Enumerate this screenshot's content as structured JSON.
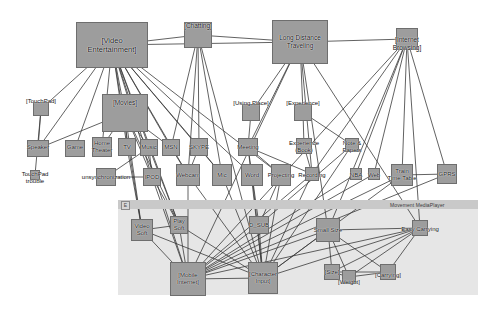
{
  "diagram": {
    "band": {
      "title": "Movement MediaPlayer",
      "icon": "E",
      "icon_name": "expand-icon"
    },
    "colors": {
      "node_fill": "#9d9d9d",
      "node_stroke": "#6e6e6e",
      "edge": "#3a3a3a",
      "band_header": "#c9c9c9",
      "band_body": "#e6e6e6",
      "text": "#111111",
      "background": "#ffffff"
    },
    "nodes": [
      {
        "id": "video_entertainment",
        "label": "[Video\nEntertainment]",
        "x": 76,
        "y": 22,
        "w": 72,
        "h": 46,
        "lx": 112,
        "ly": 45,
        "cls": "lg"
      },
      {
        "id": "chatting",
        "label": "[Chatting]",
        "x": 184,
        "y": 22,
        "w": 28,
        "h": 26,
        "lx": 198,
        "ly": 26,
        "cls": ""
      },
      {
        "id": "long_distance_traveling",
        "label": "Long Distance\nTraveling",
        "x": 272,
        "y": 20,
        "w": 56,
        "h": 44,
        "lx": 300,
        "ly": 41,
        "cls": ""
      },
      {
        "id": "internet_browsing",
        "label": "[Internet\nBrowsing]",
        "x": 396,
        "y": 28,
        "w": 22,
        "h": 22,
        "lx": 407,
        "ly": 43,
        "cls": ""
      },
      {
        "id": "touchpad",
        "label": "[TouchPad]",
        "x": 33,
        "y": 102,
        "w": 16,
        "h": 14,
        "lx": 41,
        "ly": 101,
        "cls": "sm"
      },
      {
        "id": "movies",
        "label": "[Movies]",
        "x": 102,
        "y": 94,
        "w": 46,
        "h": 38,
        "lx": 125,
        "ly": 103,
        "cls": ""
      },
      {
        "id": "using_place",
        "label": "[Using Place]",
        "x": 242,
        "y": 104,
        "w": 18,
        "h": 17,
        "lx": 251,
        "ly": 103,
        "cls": "sm"
      },
      {
        "id": "experience",
        "label": "[Experience]",
        "x": 294,
        "y": 104,
        "w": 18,
        "h": 17,
        "lx": 303,
        "ly": 103,
        "cls": "sm"
      },
      {
        "id": "speaker",
        "label": "Speaker",
        "x": 27,
        "y": 140,
        "w": 22,
        "h": 17,
        "lx": 38,
        "ly": 147,
        "cls": "sm"
      },
      {
        "id": "game",
        "label": "Game",
        "x": 65,
        "y": 140,
        "w": 20,
        "h": 17,
        "lx": 75,
        "ly": 147,
        "cls": "sm"
      },
      {
        "id": "home_theater",
        "label": "Home\nTheater",
        "x": 92,
        "y": 137,
        "w": 20,
        "h": 20,
        "lx": 102,
        "ly": 147,
        "cls": "sm"
      },
      {
        "id": "tv",
        "label": "TV",
        "x": 118,
        "y": 138,
        "w": 18,
        "h": 18,
        "lx": 127,
        "ly": 147,
        "cls": "sm"
      },
      {
        "id": "music",
        "label": "Music",
        "x": 140,
        "y": 139,
        "w": 18,
        "h": 17,
        "lx": 149,
        "ly": 147,
        "cls": "sm"
      },
      {
        "id": "msn",
        "label": "MSN",
        "x": 162,
        "y": 139,
        "w": 18,
        "h": 17,
        "lx": 171,
        "ly": 147,
        "cls": "sm"
      },
      {
        "id": "skype",
        "label": "SKYPE",
        "x": 190,
        "y": 138,
        "w": 18,
        "h": 18,
        "lx": 199,
        "ly": 147,
        "cls": "sm"
      },
      {
        "id": "meeting",
        "label": "Meeting",
        "x": 238,
        "y": 138,
        "w": 20,
        "h": 18,
        "lx": 248,
        "ly": 147,
        "cls": "sm"
      },
      {
        "id": "experience_book",
        "label": "Experience\n(Book)",
        "x": 296,
        "y": 138,
        "w": 16,
        "h": 16,
        "lx": 304,
        "ly": 147,
        "cls": "sm"
      },
      {
        "id": "note_papers",
        "label": "Note &\nPapers",
        "x": 345,
        "y": 138,
        "w": 14,
        "h": 14,
        "lx": 352,
        "ly": 147,
        "cls": "sm"
      },
      {
        "id": "touchpad_trouble",
        "label": "TouchPad\ntrouble",
        "x": 30,
        "y": 170,
        "w": 10,
        "h": 10,
        "lx": 35,
        "ly": 178,
        "cls": "sm"
      },
      {
        "id": "unsynchronization",
        "label": "unsynchronization",
        "x": 96,
        "y": 168,
        "w": 20,
        "h": 18,
        "lx": 106,
        "ly": 177,
        "cls": "sm"
      },
      {
        "id": "ipod",
        "label": "IPOD",
        "x": 143,
        "y": 168,
        "w": 18,
        "h": 18,
        "lx": 152,
        "ly": 177,
        "cls": "sm"
      },
      {
        "id": "webcam",
        "label": "Webcam",
        "x": 176,
        "y": 164,
        "w": 24,
        "h": 22,
        "lx": 188,
        "ly": 175,
        "cls": "sm"
      },
      {
        "id": "mic",
        "label": "Mic",
        "x": 212,
        "y": 164,
        "w": 20,
        "h": 22,
        "lx": 222,
        "ly": 175,
        "cls": "sm"
      },
      {
        "id": "word",
        "label": "Word",
        "x": 241,
        "y": 164,
        "w": 22,
        "h": 22,
        "lx": 252,
        "ly": 175,
        "cls": "sm"
      },
      {
        "id": "projecting",
        "label": "Projecting",
        "x": 271,
        "y": 164,
        "w": 20,
        "h": 22,
        "lx": 281,
        "ly": 175,
        "cls": "sm"
      },
      {
        "id": "recording",
        "label": "Recording",
        "x": 305,
        "y": 167,
        "w": 14,
        "h": 14,
        "lx": 312,
        "ly": 175,
        "cls": "sm"
      },
      {
        "id": "nba",
        "label": "NBA",
        "x": 350,
        "y": 168,
        "w": 12,
        "h": 12,
        "lx": 356,
        "ly": 175,
        "cls": "sm"
      },
      {
        "id": "web",
        "label": "Web",
        "x": 368,
        "y": 168,
        "w": 12,
        "h": 12,
        "lx": 374,
        "ly": 175,
        "cls": "sm"
      },
      {
        "id": "train_time_table",
        "label": "Train\nTime Table",
        "x": 391,
        "y": 164,
        "w": 22,
        "h": 22,
        "lx": 402,
        "ly": 175,
        "cls": "sm"
      },
      {
        "id": "gprs",
        "label": "GPRS",
        "x": 437,
        "y": 164,
        "w": 20,
        "h": 20,
        "lx": 447,
        "ly": 174,
        "cls": "sm"
      },
      {
        "id": "video_soft",
        "label": "Video\nSoft",
        "x": 131,
        "y": 219,
        "w": 22,
        "h": 22,
        "lx": 142,
        "ly": 230,
        "cls": "sm"
      },
      {
        "id": "play_soft",
        "label": "Play\nSoft",
        "x": 170,
        "y": 216,
        "w": 18,
        "h": 18,
        "lx": 179,
        "ly": 225,
        "cls": "sm"
      },
      {
        "id": "d_sub",
        "label": "D_SUB",
        "x": 249,
        "y": 216,
        "w": 20,
        "h": 18,
        "lx": 259,
        "ly": 225,
        "cls": "sm"
      },
      {
        "id": "small_size",
        "label": "Small Size",
        "x": 316,
        "y": 218,
        "w": 24,
        "h": 24,
        "lx": 328,
        "ly": 230,
        "cls": "sm"
      },
      {
        "id": "easy_carrying",
        "label": "Easy Carrying",
        "x": 412,
        "y": 220,
        "w": 16,
        "h": 16,
        "lx": 420,
        "ly": 229,
        "cls": "sm"
      },
      {
        "id": "mobile_internet",
        "label": "[Mobile\nInternet]",
        "x": 170,
        "y": 262,
        "w": 36,
        "h": 34,
        "lx": 188,
        "ly": 279,
        "cls": "sm"
      },
      {
        "id": "character_input",
        "label": "[Character\nInput]",
        "x": 248,
        "y": 262,
        "w": 30,
        "h": 32,
        "lx": 263,
        "ly": 278,
        "cls": "sm"
      },
      {
        "id": "size",
        "label": "[Size]",
        "x": 324,
        "y": 264,
        "w": 16,
        "h": 16,
        "lx": 332,
        "ly": 272,
        "cls": "sm"
      },
      {
        "id": "weight",
        "label": "[Weight]",
        "x": 342,
        "y": 270,
        "w": 14,
        "h": 14,
        "lx": 349,
        "ly": 282,
        "cls": "sm"
      },
      {
        "id": "carrying",
        "label": "[Carrying]",
        "x": 380,
        "y": 264,
        "w": 16,
        "h": 16,
        "lx": 388,
        "ly": 275,
        "cls": "sm"
      }
    ],
    "edges": [
      [
        "video_entertainment",
        "touchpad"
      ],
      [
        "video_entertainment",
        "speaker"
      ],
      [
        "video_entertainment",
        "game"
      ],
      [
        "video_entertainment",
        "home_theater"
      ],
      [
        "video_entertainment",
        "movies"
      ],
      [
        "video_entertainment",
        "tv"
      ],
      [
        "video_entertainment",
        "music"
      ],
      [
        "video_entertainment",
        "msn"
      ],
      [
        "video_entertainment",
        "skype"
      ],
      [
        "video_entertainment",
        "chatting"
      ],
      [
        "video_entertainment",
        "webcam"
      ],
      [
        "video_entertainment",
        "mic"
      ],
      [
        "video_entertainment",
        "word"
      ],
      [
        "video_entertainment",
        "projecting"
      ],
      [
        "video_entertainment",
        "ipod"
      ],
      [
        "video_entertainment",
        "long_distance_traveling"
      ],
      [
        "video_entertainment",
        "video_soft"
      ],
      [
        "video_entertainment",
        "play_soft"
      ],
      [
        "video_entertainment",
        "mobile_internet"
      ],
      [
        "chatting",
        "msn"
      ],
      [
        "chatting",
        "skype"
      ],
      [
        "chatting",
        "webcam"
      ],
      [
        "chatting",
        "mic"
      ],
      [
        "chatting",
        "long_distance_traveling"
      ],
      [
        "chatting",
        "character_input"
      ],
      [
        "movies",
        "tv"
      ],
      [
        "movies",
        "music"
      ],
      [
        "movies",
        "home_theater"
      ],
      [
        "movies",
        "ipod"
      ],
      [
        "movies",
        "speaker"
      ],
      [
        "movies",
        "msn"
      ],
      [
        "movies",
        "video_soft"
      ],
      [
        "movies",
        "play_soft"
      ],
      [
        "touchpad",
        "speaker"
      ],
      [
        "touchpad",
        "touchpad_trouble"
      ],
      [
        "music",
        "ipod"
      ],
      [
        "music",
        "unsynchronization"
      ],
      [
        "ipod",
        "unsynchronization"
      ],
      [
        "long_distance_traveling",
        "using_place"
      ],
      [
        "long_distance_traveling",
        "experience"
      ],
      [
        "long_distance_traveling",
        "meeting"
      ],
      [
        "long_distance_traveling",
        "internet_browsing"
      ],
      [
        "long_distance_traveling",
        "recording"
      ],
      [
        "long_distance_traveling",
        "small_size"
      ],
      [
        "long_distance_traveling",
        "easy_carrying"
      ],
      [
        "long_distance_traveling",
        "mobile_internet"
      ],
      [
        "using_place",
        "meeting"
      ],
      [
        "experience",
        "experience_book"
      ],
      [
        "experience",
        "note_papers"
      ],
      [
        "meeting",
        "word"
      ],
      [
        "meeting",
        "projecting"
      ],
      [
        "meeting",
        "recording"
      ],
      [
        "meeting",
        "character_input"
      ],
      [
        "experience_book",
        "recording"
      ],
      [
        "note_papers",
        "character_input"
      ],
      [
        "note_papers",
        "d_sub"
      ],
      [
        "internet_browsing",
        "nba"
      ],
      [
        "internet_browsing",
        "web"
      ],
      [
        "internet_browsing",
        "train_time_table"
      ],
      [
        "internet_browsing",
        "gprs"
      ],
      [
        "internet_browsing",
        "recording"
      ],
      [
        "internet_browsing",
        "mobile_internet"
      ],
      [
        "internet_browsing",
        "small_size"
      ],
      [
        "internet_browsing",
        "easy_carrying"
      ],
      [
        "train_time_table",
        "gprs"
      ],
      [
        "train_time_table",
        "mobile_internet"
      ],
      [
        "train_time_table",
        "character_input"
      ],
      [
        "nba",
        "mobile_internet"
      ],
      [
        "web",
        "mobile_internet"
      ],
      [
        "gprs",
        "mobile_internet"
      ],
      [
        "video_soft",
        "mobile_internet"
      ],
      [
        "video_soft",
        "character_input"
      ],
      [
        "video_soft",
        "play_soft"
      ],
      [
        "play_soft",
        "mobile_internet"
      ],
      [
        "play_soft",
        "character_input"
      ],
      [
        "d_sub",
        "mobile_internet"
      ],
      [
        "d_sub",
        "character_input"
      ],
      [
        "small_size",
        "size"
      ],
      [
        "small_size",
        "weight"
      ],
      [
        "small_size",
        "carrying"
      ],
      [
        "small_size",
        "easy_carrying"
      ],
      [
        "small_size",
        "character_input"
      ],
      [
        "small_size",
        "mobile_internet"
      ],
      [
        "easy_carrying",
        "size"
      ],
      [
        "easy_carrying",
        "weight"
      ],
      [
        "easy_carrying",
        "carrying"
      ],
      [
        "easy_carrying",
        "character_input"
      ],
      [
        "easy_carrying",
        "mobile_internet"
      ],
      [
        "size",
        "weight"
      ],
      [
        "size",
        "carrying"
      ],
      [
        "weight",
        "carrying"
      ],
      [
        "mobile_internet",
        "character_input"
      ],
      [
        "webcam",
        "character_input"
      ],
      [
        "webcam",
        "mobile_internet"
      ],
      [
        "mic",
        "character_input"
      ],
      [
        "word",
        "character_input"
      ],
      [
        "word",
        "d_sub"
      ],
      [
        "projecting",
        "d_sub"
      ],
      [
        "projecting",
        "character_input"
      ],
      [
        "recording",
        "character_input"
      ],
      [
        "recording",
        "mobile_internet"
      ],
      [
        "tv",
        "video_soft"
      ],
      [
        "skype",
        "webcam"
      ],
      [
        "msn",
        "webcam"
      ],
      [
        "skype",
        "mic"
      ],
      [
        "ipod",
        "play_soft"
      ],
      [
        "ipod",
        "mobile_internet"
      ],
      [
        "music",
        "play_soft"
      ]
    ]
  }
}
